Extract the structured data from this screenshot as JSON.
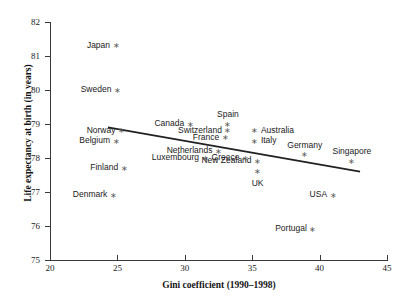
{
  "chart_data": {
    "type": "scatter",
    "title": "",
    "xlabel": "Gini coefficient (1990–1998)",
    "ylabel": "Life expectancy at birth (in years)",
    "xlim": [
      20,
      45
    ],
    "ylim": [
      75,
      82
    ],
    "xticks": [
      20,
      25,
      30,
      35,
      40,
      45
    ],
    "yticks": [
      75,
      76,
      77,
      78,
      79,
      80,
      81,
      82
    ],
    "grid": false,
    "legend": "none",
    "points": [
      {
        "label": "Japan",
        "x": 24.9,
        "y": 81.3,
        "label_pos": "left"
      },
      {
        "label": "Sweden",
        "x": 25.0,
        "y": 80.0,
        "label_pos": "left"
      },
      {
        "label": "Norway",
        "x": 25.3,
        "y": 78.8,
        "label_pos": "left"
      },
      {
        "label": "Belgium",
        "x": 24.9,
        "y": 78.5,
        "label_pos": "left"
      },
      {
        "label": "Finland",
        "x": 25.5,
        "y": 77.7,
        "label_pos": "left"
      },
      {
        "label": "Denmark",
        "x": 24.7,
        "y": 76.9,
        "label_pos": "left"
      },
      {
        "label": "Canada",
        "x": 30.4,
        "y": 79.0,
        "label_pos": "left"
      },
      {
        "label": "Spain",
        "x": 33.2,
        "y": 79.0,
        "label_pos": "above"
      },
      {
        "label": "Switzerland",
        "x": 33.2,
        "y": 78.8,
        "label_pos": "left"
      },
      {
        "label": "France",
        "x": 33.0,
        "y": 78.6,
        "label_pos": "left"
      },
      {
        "label": "Netherlands",
        "x": 32.5,
        "y": 78.2,
        "label_pos": "left"
      },
      {
        "label": "Luxembourg",
        "x": 31.5,
        "y": 78.0,
        "label_pos": "left"
      },
      {
        "label": "Australia",
        "x": 35.2,
        "y": 78.8,
        "label_pos": "right"
      },
      {
        "label": "Italy",
        "x": 35.2,
        "y": 78.5,
        "label_pos": "right"
      },
      {
        "label": "New Zealand",
        "x": 35.4,
        "y": 77.9,
        "label_pos": "left"
      },
      {
        "label": "Greece",
        "x": 34.5,
        "y": 78.0,
        "label_pos": "left"
      },
      {
        "label": "UK",
        "x": 35.4,
        "y": 77.6,
        "label_pos": "below"
      },
      {
        "label": "Germany",
        "x": 38.9,
        "y": 78.1,
        "label_pos": "above"
      },
      {
        "label": "Singapore",
        "x": 42.4,
        "y": 77.9,
        "label_pos": "above"
      },
      {
        "label": "USA",
        "x": 41.0,
        "y": 76.9,
        "label_pos": "left"
      },
      {
        "label": "Portugal",
        "x": 39.5,
        "y": 75.9,
        "label_pos": "left"
      }
    ],
    "trendline": {
      "x1": 24.3,
      "y1": 78.9,
      "x2": 43.0,
      "y2": 77.6
    }
  }
}
